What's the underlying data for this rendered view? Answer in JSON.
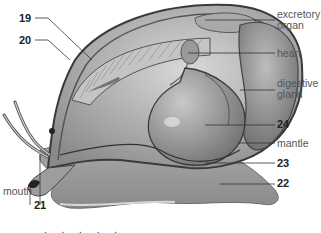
{
  "diagram": {
    "labels": {
      "excretory_organ": "excretory organ",
      "excretory_line1": "excretory",
      "excretory_line2": "organ",
      "heart": "heart",
      "digestive_line1": "digestive",
      "digestive_line2": "gland",
      "mantle": "mantle",
      "mouth": "mouth"
    },
    "numbers": {
      "n19": "19",
      "n20": "20",
      "n21": "21",
      "n22": "22",
      "n23": "23",
      "n24": "24"
    },
    "caption_fragment": ". . . . ."
  }
}
